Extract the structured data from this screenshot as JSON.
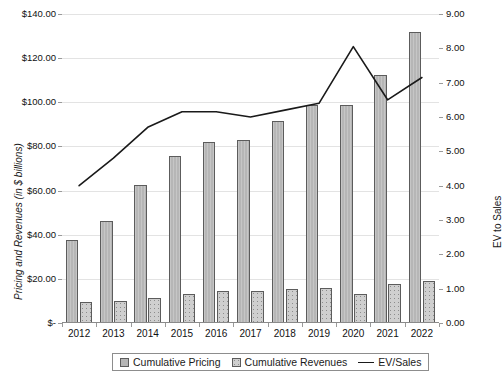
{
  "chart_data": {
    "type": "bar",
    "title": "",
    "xlabel": "",
    "ylabel": "Pricing and Revenues (in $ billions)",
    "y2label": "EV to Sales",
    "grid": true,
    "legend_position": "bottom",
    "categories": [
      "2012",
      "2013",
      "2014",
      "2015",
      "2016",
      "2017",
      "2018",
      "2019",
      "2020",
      "2021",
      "2022"
    ],
    "ylim": [
      0,
      140
    ],
    "y2lim": [
      0,
      9
    ],
    "y_ticks": [
      "$-",
      "$20.00",
      "$40.00",
      "$60.00",
      "$80.00",
      "$100.00",
      "$120.00",
      "$140.00"
    ],
    "y_tick_values": [
      0,
      20,
      40,
      60,
      80,
      100,
      120,
      140
    ],
    "y2_ticks": [
      "0.00",
      "1.00",
      "2.00",
      "3.00",
      "4.00",
      "5.00",
      "6.00",
      "7.00",
      "8.00",
      "9.00"
    ],
    "y2_tick_values": [
      0,
      1,
      2,
      3,
      4,
      5,
      6,
      7,
      8,
      9
    ],
    "series": [
      {
        "name": "Cumulative Pricing",
        "type": "bar",
        "axis": "left",
        "color": "#b6b6b6",
        "values": [
          37.7,
          46.0,
          62.5,
          75.5,
          82.0,
          83.0,
          91.5,
          99.0,
          99.0,
          112.5,
          132.0
        ]
      },
      {
        "name": "Cumulative Revenues",
        "type": "bar",
        "axis": "left",
        "color": "#cfcfcf",
        "values": [
          9.5,
          10.0,
          11.5,
          13.0,
          14.5,
          14.5,
          15.5,
          16.0,
          13.0,
          17.5,
          19.0
        ]
      },
      {
        "name": "EV/Sales",
        "type": "line",
        "axis": "right",
        "color": "#1a1a1a",
        "values": [
          4.0,
          4.8,
          5.7,
          6.15,
          6.15,
          6.0,
          6.2,
          6.4,
          8.05,
          6.5,
          7.15
        ]
      }
    ]
  },
  "legend": {
    "items": [
      {
        "label": "Cumulative Pricing",
        "marker": "square-swatch-pricing"
      },
      {
        "label": "Cumulative Revenues",
        "marker": "square-swatch-revenues"
      },
      {
        "label": "EV/Sales",
        "marker": "line-swatch"
      }
    ]
  }
}
